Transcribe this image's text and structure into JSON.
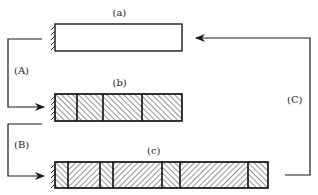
{
  "diagram": {
    "bars": [
      {
        "id": "a",
        "label": "(a)",
        "x": 55,
        "y": 24,
        "w": 127,
        "h": 27,
        "segments": []
      },
      {
        "id": "b",
        "label": "(b)",
        "x": 55,
        "y": 94,
        "w": 127,
        "h": 27,
        "segments": [
          {
            "x0": 55,
            "x1": 77,
            "hatch": "back"
          },
          {
            "x0": 77,
            "x1": 103,
            "hatch": "back"
          },
          {
            "x0": 103,
            "x1": 142,
            "hatch": "back"
          },
          {
            "x0": 142,
            "x1": 182,
            "hatch": "back"
          }
        ]
      },
      {
        "id": "c",
        "label": "(c)",
        "x": 55,
        "y": 162,
        "w": 213,
        "h": 26,
        "segments": [
          {
            "x0": 55,
            "x1": 68,
            "hatch": "back"
          },
          {
            "x0": 68,
            "x1": 100,
            "hatch": "fwd"
          },
          {
            "x0": 100,
            "x1": 113,
            "hatch": "back"
          },
          {
            "x0": 113,
            "x1": 162,
            "hatch": "fwd"
          },
          {
            "x0": 162,
            "x1": 180,
            "hatch": "back"
          },
          {
            "x0": 180,
            "x1": 248,
            "hatch": "fwd"
          },
          {
            "x0": 248,
            "x1": 268,
            "hatch": "back"
          }
        ]
      }
    ],
    "arrows": [
      {
        "id": "A",
        "label": "(A)",
        "points": "42,39 8,39 8,107 44,107",
        "label_x": 14,
        "label_y": 74
      },
      {
        "id": "B",
        "label": "(B)",
        "points": "42,124 8,124 8,176 44,176",
        "label_x": 14,
        "label_y": 148
      },
      {
        "id": "C",
        "label": "(C)",
        "points": "285,175 310,175 310,38 196,38",
        "label_x": 287,
        "label_y": 103
      }
    ],
    "colors": {
      "line": "#1a1a1a",
      "background": "#ffffff"
    }
  }
}
